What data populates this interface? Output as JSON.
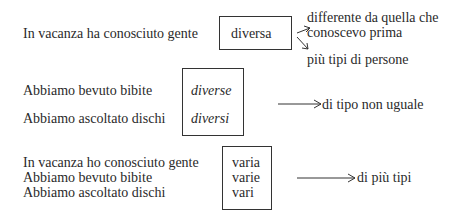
{
  "section1": {
    "sentence": "In vacanza ha conosciuto gente",
    "boxed_word": "diversa",
    "meaning1_line1": "differente da quella che",
    "meaning1_line2": "conoscevo prima",
    "meaning2": "più tipi di persone"
  },
  "section2": {
    "sentences": [
      "Abbiamo bevuto bibite",
      "Abbiamo ascoltato dischi"
    ],
    "boxed_words": [
      "diverse",
      "diversi"
    ],
    "meaning": "di tipo non uguale"
  },
  "section3": {
    "sentences": [
      "In vacanza ho conosciuto gente",
      "Abbiamo bevuto bibite",
      "Abbiamo ascoltato dischi"
    ],
    "boxed_words": [
      "varia",
      "varie",
      "vari"
    ],
    "meaning": "di più tipi"
  }
}
